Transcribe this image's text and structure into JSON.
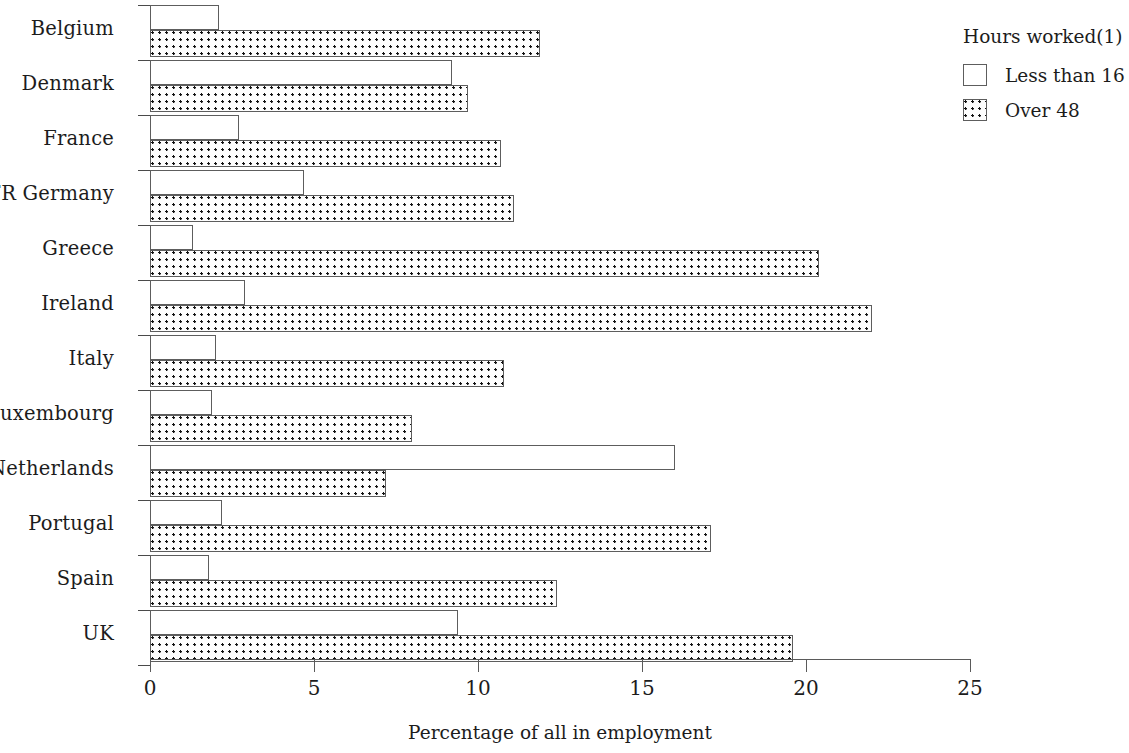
{
  "chart_data": {
    "type": "bar",
    "orientation": "horizontal",
    "title": "",
    "xlabel": "Percentage of  all in employment",
    "ylabel": "",
    "xlim": [
      0,
      25
    ],
    "xticks": [
      0,
      5,
      10,
      15,
      20,
      25
    ],
    "xtick_labels": [
      "0",
      "5",
      "10",
      "15",
      "20",
      "25"
    ],
    "grid": false,
    "legend_position": "top-right",
    "legend_title": "Hours worked(1)",
    "categories": [
      "Belgium",
      "Denmark",
      "France",
      "FR Germany",
      "Greece",
      "Ireland",
      "Italy",
      "Luxembourg",
      "Netherlands",
      "Portugal",
      "Spain",
      "UK"
    ],
    "series": [
      {
        "name": "Less than 16",
        "pattern": "open",
        "values": [
          2.1,
          9.2,
          2.7,
          4.7,
          1.3,
          2.9,
          2.0,
          1.9,
          16.0,
          2.2,
          1.8,
          9.4
        ]
      },
      {
        "name": "Over 48",
        "pattern": "dotted",
        "values": [
          11.9,
          9.7,
          10.7,
          11.1,
          20.4,
          22.0,
          10.8,
          8.0,
          7.2,
          17.1,
          12.4,
          19.6
        ]
      }
    ]
  },
  "legend": {
    "title": "Hours worked(1)",
    "items": [
      {
        "label": "Less than 16",
        "swatch": "open-square-icon"
      },
      {
        "label": "Over 48",
        "swatch": "dotted-square-icon"
      }
    ]
  },
  "axis": {
    "x_title": "Percentage of  all in employment",
    "ticks": [
      "0",
      "5",
      "10",
      "15",
      "20",
      "25"
    ]
  },
  "colors": {
    "background": "#ffffff",
    "bar_outline": "#5d5d5d",
    "bar_fill_open": "#ffffff",
    "dot_color": "#111111",
    "text": "#1c1c1c",
    "axis": "#5a5a5a"
  }
}
